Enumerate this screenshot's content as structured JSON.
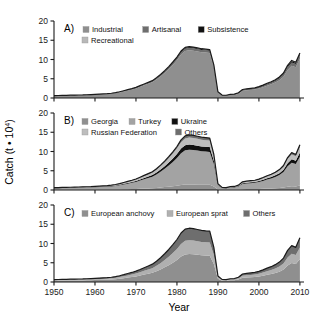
{
  "figure": {
    "xlabel": "Year",
    "ylabel": "Catch (t • 10",
    "ylabel_exp": "4",
    "ylabel_close": ")",
    "y_ticks": [
      "0",
      "5",
      "10",
      "15",
      "20"
    ],
    "x_ticks": [
      "1950",
      "1960",
      "1970",
      "1980",
      "1990",
      "2000",
      "2010"
    ],
    "panel_a_label": "A)",
    "panel_b_label": "B)",
    "panel_c_label": "C)"
  },
  "colors": {
    "light_gray": "#c9c9c9",
    "mid_gray": "#8f8f8f",
    "main_gray": "#808080",
    "dark_gray": "#595959",
    "black": "#111111",
    "axis": "#1a1a1a",
    "background": "#ffffff"
  },
  "legends": {
    "a": [
      {
        "label": "Industrial",
        "color": "#8f8f8f"
      },
      {
        "label": "Artisanal",
        "color": "#6e6e6e"
      },
      {
        "label": "Subsistence",
        "color": "#111111"
      },
      {
        "label": "Recreational",
        "color": "#b8b8b8"
      }
    ],
    "b": [
      {
        "label": "Georgia",
        "color": "#8f8f8f"
      },
      {
        "label": "Turkey",
        "color": "#a3a3a3"
      },
      {
        "label": "Ukraine",
        "color": "#111111"
      },
      {
        "label": "Russian Federation",
        "color": "#bdbdbd"
      },
      {
        "label": "Others",
        "color": "#6e6e6e"
      }
    ],
    "c": [
      {
        "label": "European anchovy",
        "color": "#8f8f8f"
      },
      {
        "label": "European sprat",
        "color": "#b0b0b0"
      },
      {
        "label": "Others",
        "color": "#6e6e6e"
      }
    ]
  },
  "chart_data": {
    "type": "area",
    "title": "",
    "xlabel": "Year",
    "ylabel": "Catch (t • 10^4)",
    "xlim": [
      1950,
      2011
    ],
    "ylim": [
      0,
      20
    ],
    "grid": false,
    "legend_position": "top-inside",
    "x": [
      1950,
      1951,
      1952,
      1953,
      1954,
      1955,
      1956,
      1957,
      1958,
      1959,
      1960,
      1961,
      1962,
      1963,
      1964,
      1965,
      1966,
      1967,
      1968,
      1969,
      1970,
      1971,
      1972,
      1973,
      1974,
      1975,
      1976,
      1977,
      1978,
      1979,
      1980,
      1981,
      1982,
      1983,
      1984,
      1985,
      1986,
      1987,
      1988,
      1989,
      1990,
      1991,
      1992,
      1993,
      1994,
      1995,
      1996,
      1997,
      1998,
      1999,
      2000,
      2001,
      2002,
      2003,
      2004,
      2005,
      2006,
      2007,
      2008,
      2009,
      2010
    ],
    "panels": [
      {
        "id": "A",
        "label": "A)",
        "stack_order": [
          "Industrial",
          "Artisanal",
          "Subsistence",
          "Recreational"
        ],
        "series": [
          {
            "name": "Industrial",
            "color": "#8f8f8f",
            "values": [
              0.55,
              0.58,
              0.6,
              0.62,
              0.65,
              0.68,
              0.7,
              0.72,
              0.75,
              0.8,
              0.85,
              0.9,
              0.95,
              1.0,
              1.1,
              1.25,
              1.45,
              1.7,
              1.95,
              2.2,
              2.5,
              2.9,
              3.3,
              3.7,
              4.1,
              4.8,
              5.6,
              6.5,
              7.5,
              8.6,
              9.8,
              11.3,
              12.2,
              12.4,
              12.3,
              12.1,
              11.9,
              11.8,
              11.7,
              8.0,
              1.4,
              0.6,
              0.55,
              0.75,
              0.8,
              1.1,
              1.85,
              2.0,
              2.1,
              2.2,
              2.45,
              2.8,
              3.2,
              3.55,
              4.0,
              4.6,
              5.5,
              7.3,
              8.4,
              8.0,
              10.2
            ]
          },
          {
            "name": "Artisanal",
            "color": "#6e6e6e",
            "values": [
              0.05,
              0.05,
              0.05,
              0.05,
              0.06,
              0.06,
              0.06,
              0.06,
              0.07,
              0.07,
              0.07,
              0.08,
              0.08,
              0.08,
              0.09,
              0.1,
              0.11,
              0.12,
              0.14,
              0.15,
              0.17,
              0.19,
              0.21,
              0.23,
              0.25,
              0.3,
              0.34,
              0.39,
              0.44,
              0.5,
              0.55,
              0.6,
              0.62,
              0.62,
              0.61,
              0.6,
              0.59,
              0.58,
              0.57,
              0.4,
              0.12,
              0.1,
              0.1,
              0.12,
              0.13,
              0.16,
              0.22,
              0.24,
              0.26,
              0.28,
              0.3,
              0.34,
              0.38,
              0.42,
              0.47,
              0.54,
              0.62,
              0.75,
              0.85,
              0.8,
              0.95
            ]
          },
          {
            "name": "Subsistence",
            "color": "#111111",
            "values": [
              0.02,
              0.02,
              0.02,
              0.02,
              0.02,
              0.02,
              0.02,
              0.02,
              0.03,
              0.03,
              0.03,
              0.03,
              0.03,
              0.03,
              0.04,
              0.04,
              0.05,
              0.05,
              0.06,
              0.06,
              0.07,
              0.08,
              0.09,
              0.1,
              0.11,
              0.12,
              0.13,
              0.15,
              0.17,
              0.19,
              0.21,
              0.23,
              0.24,
              0.24,
              0.24,
              0.23,
              0.23,
              0.22,
              0.22,
              0.16,
              0.06,
              0.05,
              0.05,
              0.06,
              0.06,
              0.08,
              0.1,
              0.11,
              0.12,
              0.13,
              0.14,
              0.16,
              0.18,
              0.2,
              0.22,
              0.25,
              0.29,
              0.34,
              0.38,
              0.36,
              0.42
            ]
          },
          {
            "name": "Recreational",
            "color": "#b8b8b8",
            "values": [
              0.0,
              0.0,
              0.0,
              0.0,
              0.0,
              0.0,
              0.0,
              0.0,
              0.0,
              0.0,
              0.01,
              0.01,
              0.01,
              0.01,
              0.01,
              0.01,
              0.02,
              0.02,
              0.02,
              0.02,
              0.03,
              0.03,
              0.03,
              0.04,
              0.04,
              0.04,
              0.05,
              0.05,
              0.06,
              0.06,
              0.07,
              0.07,
              0.08,
              0.08,
              0.08,
              0.08,
              0.08,
              0.08,
              0.08,
              0.06,
              0.02,
              0.02,
              0.02,
              0.02,
              0.02,
              0.03,
              0.03,
              0.04,
              0.04,
              0.04,
              0.05,
              0.05,
              0.06,
              0.06,
              0.07,
              0.08,
              0.09,
              0.1,
              0.12,
              0.11,
              0.13
            ]
          }
        ]
      },
      {
        "id": "B",
        "label": "B)",
        "stack_order": [
          "Georgia",
          "Turkey",
          "Ukraine",
          "Russian Federation",
          "Others"
        ],
        "series": [
          {
            "name": "Georgia",
            "color": "#8f8f8f",
            "values": [
              0.05,
              0.05,
              0.05,
              0.05,
              0.06,
              0.06,
              0.06,
              0.07,
              0.07,
              0.08,
              0.08,
              0.09,
              0.1,
              0.11,
              0.12,
              0.14,
              0.16,
              0.19,
              0.22,
              0.25,
              0.28,
              0.33,
              0.38,
              0.42,
              0.47,
              0.55,
              0.64,
              0.75,
              0.86,
              0.99,
              1.12,
              1.3,
              1.4,
              1.42,
              1.41,
              1.39,
              1.37,
              1.35,
              1.34,
              0.92,
              0.16,
              0.07,
              0.06,
              0.09,
              0.09,
              0.13,
              0.21,
              0.23,
              0.24,
              0.25,
              0.28,
              0.32,
              0.37,
              0.41,
              0.46,
              0.53,
              0.63,
              0.84,
              0.97,
              0.92,
              1.17
            ]
          },
          {
            "name": "Turkey",
            "color": "#a3a3a3",
            "values": [
              0.4,
              0.42,
              0.44,
              0.45,
              0.47,
              0.5,
              0.51,
              0.53,
              0.55,
              0.58,
              0.62,
              0.66,
              0.7,
              0.73,
              0.8,
              0.91,
              1.06,
              1.24,
              1.42,
              1.61,
              1.82,
              2.11,
              2.41,
              2.7,
              3.0,
              3.5,
              4.09,
              4.75,
              5.48,
              6.28,
              7.16,
              8.25,
              8.91,
              9.06,
              8.99,
              8.84,
              8.69,
              8.62,
              8.55,
              5.84,
              1.02,
              0.44,
              0.4,
              0.55,
              0.58,
              0.8,
              1.35,
              1.46,
              1.53,
              1.61,
              1.79,
              2.05,
              2.34,
              2.59,
              2.92,
              3.36,
              4.02,
              5.33,
              6.14,
              5.84,
              7.45
            ]
          },
          {
            "name": "Ukraine",
            "color": "#111111",
            "values": [
              0.06,
              0.06,
              0.06,
              0.06,
              0.07,
              0.07,
              0.07,
              0.08,
              0.08,
              0.08,
              0.09,
              0.09,
              0.1,
              0.11,
              0.12,
              0.13,
              0.15,
              0.18,
              0.21,
              0.23,
              0.26,
              0.31,
              0.35,
              0.39,
              0.44,
              0.51,
              0.6,
              0.69,
              0.8,
              0.92,
              1.04,
              1.2,
              1.3,
              1.32,
              1.31,
              1.29,
              1.27,
              1.26,
              1.25,
              0.85,
              0.15,
              0.06,
              0.06,
              0.08,
              0.09,
              0.12,
              0.2,
              0.21,
              0.22,
              0.23,
              0.26,
              0.3,
              0.34,
              0.38,
              0.43,
              0.49,
              0.59,
              0.78,
              0.9,
              0.85,
              1.09
            ]
          },
          {
            "name": "Russian Federation",
            "color": "#bdbdbd",
            "values": [
              0.08,
              0.08,
              0.08,
              0.09,
              0.09,
              0.1,
              0.1,
              0.1,
              0.11,
              0.11,
              0.12,
              0.13,
              0.14,
              0.15,
              0.16,
              0.18,
              0.21,
              0.25,
              0.28,
              0.32,
              0.36,
              0.42,
              0.48,
              0.54,
              0.6,
              0.7,
              0.82,
              0.95,
              1.1,
              1.26,
              1.43,
              1.65,
              1.78,
              1.81,
              1.8,
              1.77,
              1.74,
              1.72,
              1.71,
              1.17,
              0.2,
              0.09,
              0.08,
              0.11,
              0.12,
              0.16,
              0.27,
              0.29,
              0.31,
              0.32,
              0.36,
              0.41,
              0.47,
              0.52,
              0.58,
              0.67,
              0.8,
              1.07,
              1.23,
              1.17,
              1.49
            ]
          },
          {
            "name": "Others",
            "color": "#6e6e6e",
            "values": [
              0.03,
              0.03,
              0.03,
              0.03,
              0.03,
              0.03,
              0.04,
              0.04,
              0.04,
              0.04,
              0.05,
              0.05,
              0.05,
              0.06,
              0.06,
              0.07,
              0.08,
              0.09,
              0.11,
              0.12,
              0.14,
              0.16,
              0.18,
              0.21,
              0.23,
              0.27,
              0.31,
              0.36,
              0.42,
              0.48,
              0.55,
              0.63,
              0.68,
              0.69,
              0.68,
              0.67,
              0.66,
              0.66,
              0.65,
              0.45,
              0.08,
              0.03,
              0.03,
              0.04,
              0.04,
              0.06,
              0.1,
              0.11,
              0.12,
              0.12,
              0.14,
              0.16,
              0.18,
              0.2,
              0.22,
              0.26,
              0.31,
              0.41,
              0.47,
              0.45,
              0.57
            ]
          }
        ]
      },
      {
        "id": "C",
        "label": "C)",
        "stack_order": [
          "European anchovy",
          "European sprat",
          "Others"
        ],
        "series": [
          {
            "name": "European anchovy",
            "color": "#8f8f8f",
            "values": [
              0.32,
              0.34,
              0.35,
              0.36,
              0.38,
              0.4,
              0.41,
              0.42,
              0.44,
              0.47,
              0.5,
              0.53,
              0.56,
              0.59,
              0.64,
              0.73,
              0.85,
              0.99,
              1.14,
              1.29,
              1.46,
              1.69,
              1.93,
              2.16,
              2.4,
              2.8,
              3.27,
              3.8,
              4.38,
              5.02,
              5.73,
              6.6,
              7.13,
              7.25,
              7.19,
              7.07,
              6.95,
              6.89,
              6.84,
              4.67,
              0.82,
              0.35,
              0.32,
              0.44,
              0.47,
              0.64,
              1.08,
              1.17,
              1.23,
              1.29,
              1.43,
              1.64,
              1.87,
              2.07,
              2.34,
              2.69,
              3.22,
              4.26,
              4.91,
              4.67,
              5.96
            ]
          },
          {
            "name": "European sprat",
            "color": "#b0b0b0",
            "values": [
              0.16,
              0.17,
              0.18,
              0.18,
              0.19,
              0.2,
              0.21,
              0.21,
              0.22,
              0.23,
              0.25,
              0.27,
              0.28,
              0.3,
              0.32,
              0.36,
              0.42,
              0.49,
              0.57,
              0.64,
              0.73,
              0.84,
              0.96,
              1.08,
              1.2,
              1.4,
              1.63,
              1.9,
              2.19,
              2.51,
              2.86,
              3.3,
              3.56,
              3.62,
              3.59,
              3.53,
              3.47,
              3.44,
              3.42,
              2.33,
              0.41,
              0.18,
              0.16,
              0.22,
              0.23,
              0.32,
              0.54,
              0.58,
              0.61,
              0.64,
              0.71,
              0.82,
              0.93,
              1.03,
              1.17,
              1.34,
              1.61,
              2.13,
              2.45,
              2.33,
              2.98
            ]
          },
          {
            "name": "Others",
            "color": "#6e6e6e",
            "values": [
              0.14,
              0.14,
              0.14,
              0.15,
              0.16,
              0.16,
              0.16,
              0.17,
              0.19,
              0.2,
              0.21,
              0.22,
              0.24,
              0.25,
              0.28,
              0.31,
              0.36,
              0.42,
              0.49,
              0.55,
              0.63,
              0.72,
              0.82,
              0.92,
              1.03,
              1.2,
              1.4,
              1.63,
              1.88,
              2.15,
              2.45,
              2.83,
              3.05,
              3.1,
              3.08,
              3.03,
              2.98,
              2.95,
              2.93,
              2.0,
              0.35,
              0.15,
              0.14,
              0.19,
              0.2,
              0.27,
              0.46,
              0.5,
              0.52,
              0.55,
              0.61,
              0.7,
              0.8,
              0.88,
              1.0,
              1.15,
              1.38,
              1.83,
              2.1,
              2.0,
              2.55
            ]
          }
        ]
      }
    ]
  }
}
